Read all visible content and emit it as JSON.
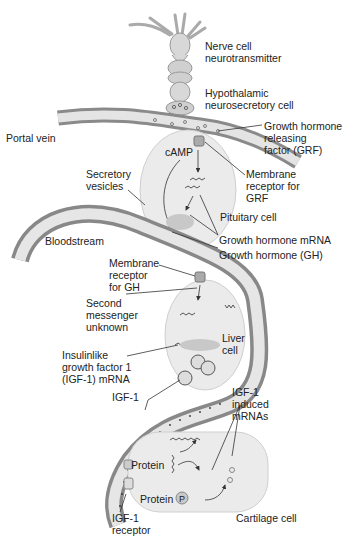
{
  "diagram": {
    "colors": {
      "vessel_light": "#e6e6e6",
      "vessel_dark": "#8c8c8c",
      "cell_fill": "#ececec",
      "text": "#222222",
      "line": "#333333"
    },
    "labels": {
      "nerve_cell": "Nerve cell\nneurotransmitter",
      "hypothalamic": "Hypothalamic\nneurosecretory cell",
      "portal_vein": "Portal vein",
      "grf": "Growth hormone\nreleasing\nfactor (GRF)",
      "camp": "cAMP",
      "membrane_grf": "Membrane\nreceptor for\nGRF",
      "secretory_vesicles": "Secretory\nvesicles",
      "pituitary_cell": "Pituitary cell",
      "bloodstream": "Bloodstream",
      "gh_mrna": "Growth hormone mRNA",
      "gh": "Growth hormone (GH)",
      "membrane_gh": "Membrane\nreceptor\nfor GH",
      "second_messenger": "Second\nmessenger\nunknown",
      "liver_cell": "Liver\ncell",
      "igf1_mrna": "Insulinlike\ngrowth factor 1\n(IGF-1) mRNA",
      "igf1": "IGF-1",
      "igf1_induced": "IGF-1\ninduced\nmRNAs",
      "protein": "Protein",
      "protein_p": "Protein",
      "p_symbol": "P",
      "cartilage_cell": "Cartilage cell",
      "igf1_receptor": "IGF-1\nreceptor"
    }
  }
}
